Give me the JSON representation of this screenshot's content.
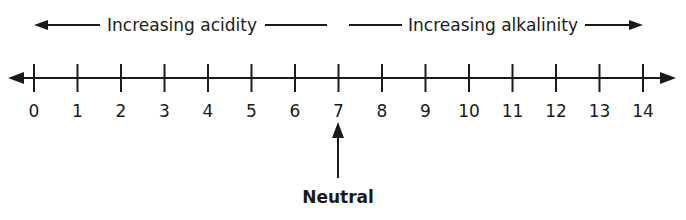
{
  "diagram": {
    "acidity_label": "Increasing acidity",
    "alkalinity_label": "Increasing alkalinity",
    "neutral_label": "Neutral",
    "neutral_value": 7,
    "scale_min": 0,
    "scale_max": 14,
    "ticks": [
      "0",
      "1",
      "2",
      "3",
      "4",
      "5",
      "6",
      "7",
      "8",
      "9",
      "10",
      "11",
      "12",
      "13",
      "14"
    ],
    "line_color": "#1a1a1a"
  }
}
